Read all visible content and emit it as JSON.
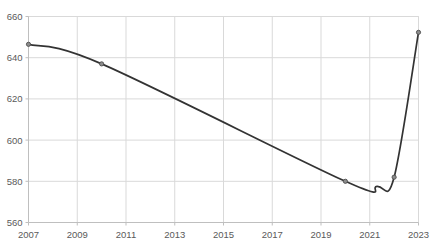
{
  "chart_data": {
    "type": "line",
    "title": "",
    "subtitle": "",
    "xlabel": "",
    "ylabel": "",
    "xlim": [
      2007,
      2023
    ],
    "ylim": [
      560,
      660
    ],
    "grid": true,
    "legend": null,
    "legend_position": "none",
    "x_ticks": [
      2007,
      2009,
      2011,
      2013,
      2015,
      2017,
      2019,
      2021,
      2023
    ],
    "x_tick_labels": [
      "2007",
      "2009",
      "2011",
      "2013",
      "2015",
      "2017",
      "2019",
      "2021",
      "2023"
    ],
    "y_ticks": [
      560,
      580,
      600,
      620,
      640,
      660
    ],
    "y_tick_labels": [
      "560",
      "580",
      "600",
      "620",
      "640",
      "660"
    ],
    "series": [
      {
        "name": "value",
        "x": [
          2007,
          2010,
          2020,
          2022,
          2023
        ],
        "values": [
          646.5,
          637.0,
          580.0,
          582.0,
          652.3
        ],
        "marker": "circle",
        "line_color": "#333333",
        "marker_color": "#7f7f7f",
        "smoothing": "spline",
        "minimum": {
          "x": 2021.3,
          "y": 577.5
        }
      }
    ],
    "colors": {
      "line": "#333333",
      "marker_fill": "#8c8c8c",
      "marker_edge": "#4d4d4d",
      "grid": "#d9d9d9",
      "axis": "#bfbfbf",
      "text": "#5a5a5a",
      "background": "#ffffff"
    }
  }
}
